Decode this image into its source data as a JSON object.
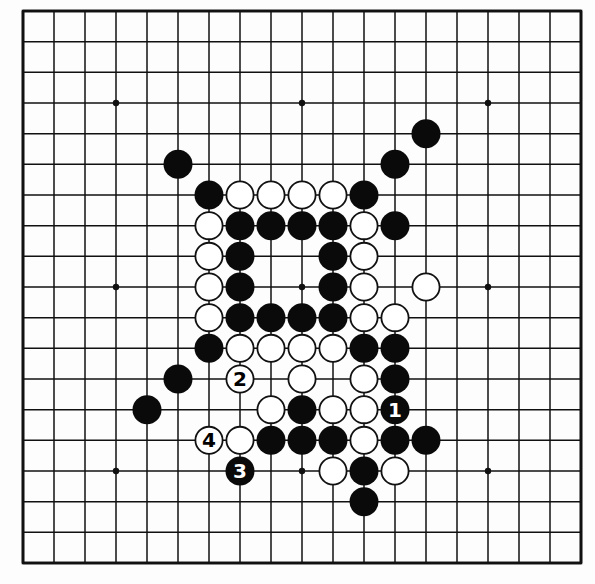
{
  "board": {
    "size": 19,
    "origin_x": 23,
    "origin_y": 11,
    "spacing_x": 31,
    "spacing_y": 30.667,
    "stone_radius": 14.5,
    "colors": {
      "line": "#111111",
      "black": "#0a0a0a",
      "white": "#ffffff",
      "background": "#fdfdfd"
    },
    "star_points": [
      [
        3,
        3
      ],
      [
        9,
        3
      ],
      [
        15,
        3
      ],
      [
        3,
        9
      ],
      [
        9,
        9
      ],
      [
        15,
        9
      ],
      [
        3,
        15
      ],
      [
        9,
        15
      ],
      [
        15,
        15
      ]
    ]
  },
  "stones": [
    {
      "col": 13,
      "row": 4,
      "color": "black"
    },
    {
      "col": 5,
      "row": 5,
      "color": "black"
    },
    {
      "col": 12,
      "row": 5,
      "color": "black"
    },
    {
      "col": 6,
      "row": 6,
      "color": "black"
    },
    {
      "col": 7,
      "row": 6,
      "color": "white"
    },
    {
      "col": 8,
      "row": 6,
      "color": "white"
    },
    {
      "col": 9,
      "row": 6,
      "color": "white"
    },
    {
      "col": 10,
      "row": 6,
      "color": "white"
    },
    {
      "col": 11,
      "row": 6,
      "color": "black"
    },
    {
      "col": 6,
      "row": 7,
      "color": "white"
    },
    {
      "col": 7,
      "row": 7,
      "color": "black"
    },
    {
      "col": 8,
      "row": 7,
      "color": "black"
    },
    {
      "col": 9,
      "row": 7,
      "color": "black"
    },
    {
      "col": 10,
      "row": 7,
      "color": "black"
    },
    {
      "col": 11,
      "row": 7,
      "color": "white"
    },
    {
      "col": 12,
      "row": 7,
      "color": "black"
    },
    {
      "col": 6,
      "row": 8,
      "color": "white"
    },
    {
      "col": 7,
      "row": 8,
      "color": "black"
    },
    {
      "col": 10,
      "row": 8,
      "color": "black"
    },
    {
      "col": 11,
      "row": 8,
      "color": "white"
    },
    {
      "col": 6,
      "row": 9,
      "color": "white"
    },
    {
      "col": 7,
      "row": 9,
      "color": "black"
    },
    {
      "col": 10,
      "row": 9,
      "color": "black"
    },
    {
      "col": 11,
      "row": 9,
      "color": "white"
    },
    {
      "col": 13,
      "row": 9,
      "color": "white"
    },
    {
      "col": 6,
      "row": 10,
      "color": "white"
    },
    {
      "col": 7,
      "row": 10,
      "color": "black"
    },
    {
      "col": 8,
      "row": 10,
      "color": "black"
    },
    {
      "col": 9,
      "row": 10,
      "color": "black"
    },
    {
      "col": 10,
      "row": 10,
      "color": "black"
    },
    {
      "col": 11,
      "row": 10,
      "color": "white"
    },
    {
      "col": 12,
      "row": 10,
      "color": "white"
    },
    {
      "col": 6,
      "row": 11,
      "color": "black"
    },
    {
      "col": 7,
      "row": 11,
      "color": "white"
    },
    {
      "col": 8,
      "row": 11,
      "color": "white"
    },
    {
      "col": 9,
      "row": 11,
      "color": "white"
    },
    {
      "col": 10,
      "row": 11,
      "color": "white"
    },
    {
      "col": 11,
      "row": 11,
      "color": "black"
    },
    {
      "col": 12,
      "row": 11,
      "color": "black"
    },
    {
      "col": 5,
      "row": 12,
      "color": "black"
    },
    {
      "col": 7,
      "row": 12,
      "color": "white",
      "label": "2"
    },
    {
      "col": 9,
      "row": 12,
      "color": "white"
    },
    {
      "col": 11,
      "row": 12,
      "color": "white"
    },
    {
      "col": 12,
      "row": 12,
      "color": "black"
    },
    {
      "col": 4,
      "row": 13,
      "color": "black"
    },
    {
      "col": 8,
      "row": 13,
      "color": "white"
    },
    {
      "col": 9,
      "row": 13,
      "color": "black"
    },
    {
      "col": 10,
      "row": 13,
      "color": "white"
    },
    {
      "col": 11,
      "row": 13,
      "color": "white"
    },
    {
      "col": 12,
      "row": 13,
      "color": "black",
      "label": "1"
    },
    {
      "col": 6,
      "row": 14,
      "color": "white",
      "label": "4"
    },
    {
      "col": 7,
      "row": 14,
      "color": "white"
    },
    {
      "col": 8,
      "row": 14,
      "color": "black"
    },
    {
      "col": 9,
      "row": 14,
      "color": "black"
    },
    {
      "col": 10,
      "row": 14,
      "color": "black"
    },
    {
      "col": 11,
      "row": 14,
      "color": "white"
    },
    {
      "col": 12,
      "row": 14,
      "color": "black"
    },
    {
      "col": 13,
      "row": 14,
      "color": "black"
    },
    {
      "col": 7,
      "row": 15,
      "color": "black",
      "label": "3"
    },
    {
      "col": 10,
      "row": 15,
      "color": "white"
    },
    {
      "col": 11,
      "row": 15,
      "color": "black"
    },
    {
      "col": 12,
      "row": 15,
      "color": "white"
    },
    {
      "col": 11,
      "row": 16,
      "color": "black"
    }
  ],
  "move_labels": [
    "1",
    "2",
    "3",
    "4"
  ]
}
